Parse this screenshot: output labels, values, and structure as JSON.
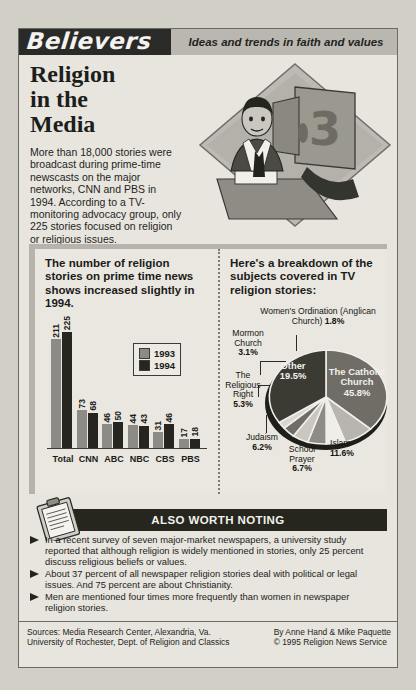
{
  "banner": {
    "logo": "Believers",
    "tagline": "Ideas and trends in faith and values"
  },
  "headline": "Religion\nin the\nMedia",
  "intro": "More than 18,000 stories were broadcast during prime-time newscasts on the major networks, CNN and PBS in 1994. According to a TV-monitoring advocacy group, only 225 stories focused on religion or religious issues.",
  "art": {
    "monitor_label": "3"
  },
  "bar_panel": {
    "heading": "The number of religion stories on prime time news shows increased slightly in 1994."
  },
  "pie_panel": {
    "heading": "Here's a breakdown of the subjects covered in TV religion stories:"
  },
  "chart_data": [
    {
      "type": "bar",
      "title": "The number of religion stories on prime time news shows increased slightly in 1994.",
      "categories": [
        "Total",
        "CNN",
        "ABC",
        "NBC",
        "CBS",
        "PBS"
      ],
      "series": [
        {
          "name": "1993",
          "color": "#8d8b85",
          "values": [
            211,
            73,
            46,
            44,
            31,
            17
          ]
        },
        {
          "name": "1994",
          "color": "#26261f",
          "values": [
            225,
            68,
            50,
            43,
            46,
            18
          ]
        }
      ],
      "xlabel": "",
      "ylabel": "",
      "ylim": [
        0,
        225
      ],
      "grid": false,
      "legend_position": "inside-right"
    },
    {
      "type": "pie",
      "title": "Here's a breakdown of the subjects covered in TV religion stories:",
      "labels": [
        "The Catholic Church",
        "Islam",
        "School Prayer",
        "Judaism",
        "The Religious Right",
        "Mormon Church",
        "Women's Ordination (Anglican Church)",
        "Other"
      ],
      "values": [
        45.8,
        11.6,
        6.7,
        6.2,
        5.3,
        3.1,
        1.8,
        19.5
      ],
      "unit": "%"
    }
  ],
  "pie_labels": [
    {
      "name": "The Catholic Church",
      "value": "45.8%",
      "placement": "inside"
    },
    {
      "name": "Other",
      "value": "19.5%",
      "placement": "inside"
    },
    {
      "name": "Women's Ordination (Anglican Church)",
      "value": "1.8%",
      "placement": "top"
    },
    {
      "name": "Mormon Church",
      "value": "3.1%",
      "placement": "left"
    },
    {
      "name": "The Religious Right",
      "value": "5.3%",
      "placement": "left"
    },
    {
      "name": "Judaism",
      "value": "6.2%",
      "placement": "bottom-left"
    },
    {
      "name": "School Prayer",
      "value": "6.7%",
      "placement": "bottom"
    },
    {
      "name": "Islam",
      "value": "11.6%",
      "placement": "bottom-right"
    }
  ],
  "also_worth_noting": {
    "title": "ALSO WORTH NOTING",
    "notes": [
      "In a recent survey of seven major-market newspapers, a university study reported that although religion is widely mentioned in stories, only 25 percent discuss religious beliefs or values.",
      "About 37 percent of all newspaper religion stories deal with political or legal issues. And 75 percent are about Christianity.",
      "Men are mentioned four times more frequently than women in newspaper religion stories."
    ]
  },
  "footer": {
    "sources": "Sources: Media Research Center, Alexandria, Va.\nUniversity of Rochester, Dept. of Religion and Classics",
    "credits": "By Anne Hand & Mike Paquette\n© 1995 Religion News Service"
  }
}
